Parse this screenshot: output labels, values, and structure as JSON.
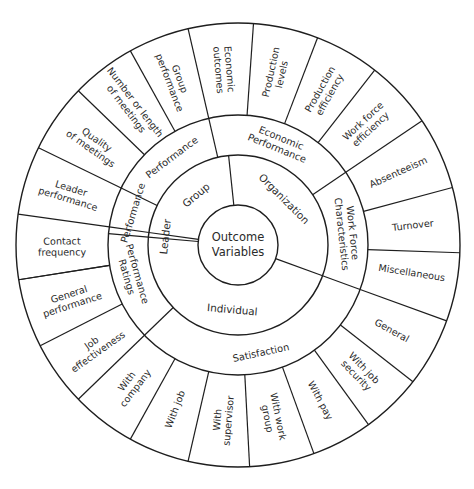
{
  "diagram": {
    "title_center": [
      "Outcome",
      "Variables"
    ],
    "center": [
      238,
      245
    ],
    "radii": {
      "core": 40,
      "inner": 90,
      "middle": 130,
      "outer": 222
    },
    "colors": {
      "line": "#1e1e1e",
      "text": "#2a2a2a",
      "background": "#ffffff"
    },
    "inner_ring": [
      {
        "label": "Group",
        "angle": 130,
        "from": 96,
        "to": 172
      },
      {
        "label": "Organization",
        "angle": 45,
        "from": -20,
        "to": 96
      },
      {
        "label": "Individual",
        "angle": 265,
        "from": 175,
        "to": 340
      },
      {
        "label": "Leader",
        "angle": 173.5,
        "from": 172,
        "to": 175
      }
    ],
    "middle_ring": [
      {
        "label": "Performance",
        "angle": 127,
        "from": 103,
        "to": 154
      },
      {
        "label": "Economic Performance",
        "lines": [
          "Economic",
          "Performance"
        ],
        "angle": 68,
        "from": 34,
        "to": 103
      },
      {
        "label": "Work Force Characteristics",
        "lines": [
          "Work Force",
          "Characteristics"
        ],
        "angle": 6,
        "from": -20,
        "to": 34
      },
      {
        "label": "Satisfaction",
        "angle": 282,
        "from": 224,
        "to": 340
      },
      {
        "label": "Performance Ratings",
        "lines": [
          "Performance",
          "Ratings"
        ],
        "angle": 196,
        "from": 175,
        "to": 224
      },
      {
        "label": "Performance",
        "angle": 163,
        "from": 154,
        "to": 172,
        "note": "Leader performance band"
      }
    ],
    "outer_ring": [
      {
        "label": "Economic outcomes",
        "lines": [
          "Economic",
          "outcomes"
        ],
        "angle": 94.5
      },
      {
        "label": "Production levels",
        "lines": [
          "Production",
          "levels"
        ],
        "angle": 77.5
      },
      {
        "label": "Production efficiency",
        "lines": [
          "Production",
          "efficiency"
        ],
        "angle": 60.5
      },
      {
        "label": "Work force efficiency",
        "lines": [
          "Work force",
          "efficiency"
        ],
        "angle": 43
      },
      {
        "label": "Absenteeism",
        "lines": [
          "Absenteeism"
        ],
        "angle": 24.5
      },
      {
        "label": "Turnover",
        "lines": [
          "Turnover"
        ],
        "angle": 6.5
      },
      {
        "label": "Miscellaneous",
        "lines": [
          "Miscellaneous"
        ],
        "angle": -9
      },
      {
        "label": "General",
        "lines": [
          "General"
        ],
        "angle": -29
      },
      {
        "label": "With job security",
        "lines": [
          "With job",
          "security"
        ],
        "angle": -46
      },
      {
        "label": "With pay",
        "lines": [
          "With pay"
        ],
        "angle": -62
      },
      {
        "label": "With work group",
        "lines": [
          "With work",
          "group"
        ],
        "angle": -78.5
      },
      {
        "label": "With supervisor",
        "lines": [
          "With",
          "supervisor"
        ],
        "angle": -95
      },
      {
        "label": "With job",
        "lines": [
          "With job"
        ],
        "angle": -111
      },
      {
        "label": "With company",
        "lines": [
          "With",
          "company"
        ],
        "angle": -127.5
      },
      {
        "label": "Job effectiveness",
        "lines": [
          "Job",
          "effectiveness"
        ],
        "angle": -144.5
      },
      {
        "label": "General performance",
        "lines": [
          "General",
          "performance"
        ],
        "angle": -162
      },
      {
        "label": "Contact frequency",
        "lines": [
          "Contact",
          "frequency"
        ],
        "angle": 180.5
      },
      {
        "label": "Leader performance",
        "lines": [
          "Leader",
          "performance"
        ],
        "angle": 163
      },
      {
        "label": "Quality of meetings",
        "lines": [
          "Quality",
          "of meetings"
        ],
        "angle": 145
      },
      {
        "label": "Number or length of meetings",
        "lines": [
          "Number or length",
          "of meetings"
        ],
        "angle": 127.5
      },
      {
        "label": "Group performance",
        "lines": [
          "Group",
          "performance"
        ],
        "angle": 111
      }
    ],
    "outer_spokes": [
      86,
      69,
      52,
      34,
      15,
      -2,
      -20,
      -38,
      -54,
      -70,
      -87,
      -103,
      -119,
      -136,
      -153,
      -171,
      189,
      172,
      154,
      136,
      119,
      103
    ],
    "middle_spokes": [
      103,
      34,
      -20,
      224,
      175,
      172,
      154
    ],
    "core_spokes": [
      96,
      -20,
      172,
      175
    ]
  }
}
